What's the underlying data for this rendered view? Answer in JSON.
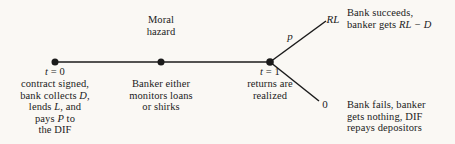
{
  "figure": {
    "type": "timeline-decision-tree",
    "background_color": "#faf8f4",
    "line_color": "#1b1b1b",
    "text_color": "#1b1b1b"
  },
  "timeline": {
    "nodes": [
      {
        "id": "t0",
        "time_label": "t = 0",
        "time_label_plain": "t",
        "time_label_rest": " = 0",
        "caption_below": "contract signed,\nbank collects D,\nlends L, and\npays P to\nthe DIF",
        "caption_above": ""
      },
      {
        "id": "moral-hazard",
        "time_label": "",
        "caption_above": "Moral\nhazard",
        "caption_below": "Banker either\nmonitors loans\nor shirks"
      },
      {
        "id": "t1",
        "time_label": "t = 1",
        "time_label_plain": "t",
        "time_label_rest": " = 1",
        "caption_above": "",
        "caption_below": "returns are\nrealized"
      }
    ]
  },
  "branches": [
    {
      "id": "success",
      "probability_label": "p",
      "payoff_label": "RL",
      "outcome_line1": "Bank succeeds,",
      "outcome_line2_prefix": "banker gets ",
      "outcome_line2_math": "RL − D",
      "outcome_text": "Bank succeeds,\nbanker gets RL − D"
    },
    {
      "id": "failure",
      "probability_label": "",
      "payoff_label": "0",
      "outcome_line1": "Bank fails, banker",
      "outcome_line2": "gets nothing, DIF",
      "outcome_line3": "repays depositors",
      "outcome_text": "Bank fails, banker\ngets nothing, DIF\nrepays depositors"
    }
  ]
}
